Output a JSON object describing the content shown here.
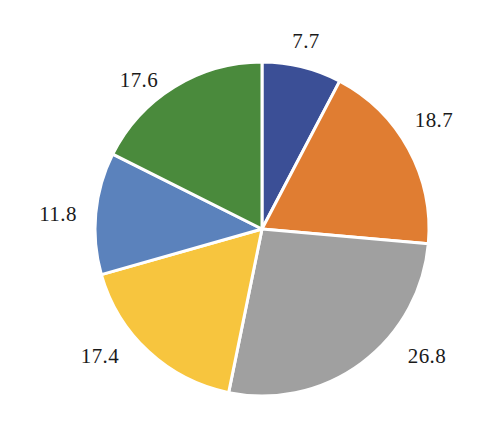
{
  "chart_data": {
    "type": "pie",
    "title": "",
    "subtitle": "",
    "xlabel": "",
    "ylabel": "",
    "grid": false,
    "legend": "none",
    "start_angle_deg": 0,
    "direction": "clockwise",
    "background": "#ffffff",
    "slice_border_color": "#ffffff",
    "slice_border_width": 3,
    "label_color": "#1a1a1a",
    "label_position": "outside",
    "labels": [
      "7.7",
      "18.7",
      "26.8",
      "17.4",
      "11.8",
      "17.6"
    ],
    "values": [
      7.7,
      18.7,
      26.8,
      17.4,
      11.8,
      17.6
    ],
    "total": 100.0,
    "colors": [
      "#3b4f96",
      "#e07d32",
      "#a0a0a0",
      "#f7c53e",
      "#5b82bc",
      "#4a8a3c"
    ],
    "slices": [
      {
        "label": "7.7",
        "value": 7.7,
        "color": "#3b4f96",
        "color_name": "dark-blue",
        "label_x": 306,
        "label_y": 41
      },
      {
        "label": "18.7",
        "value": 18.7,
        "color": "#e07d32",
        "color_name": "orange",
        "label_x": 434,
        "label_y": 120
      },
      {
        "label": "26.8",
        "value": 26.8,
        "color": "#a0a0a0",
        "color_name": "gray",
        "label_x": 427,
        "label_y": 356
      },
      {
        "label": "17.4",
        "value": 17.4,
        "color": "#f7c53e",
        "color_name": "yellow",
        "label_x": 100,
        "label_y": 356
      },
      {
        "label": "11.8",
        "value": 11.8,
        "color": "#5b82bc",
        "color_name": "medium-blue",
        "label_x": 58,
        "label_y": 214
      },
      {
        "label": "17.6",
        "value": 17.6,
        "color": "#4a8a3c",
        "color_name": "green",
        "label_x": 139,
        "label_y": 80
      }
    ],
    "geometry": {
      "center_x": 262,
      "center_y": 229,
      "radius": 167
    }
  }
}
